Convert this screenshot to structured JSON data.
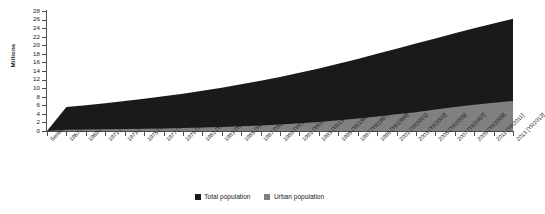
{
  "chart_data": {
    "type": "area",
    "title": "",
    "subtitle": "",
    "xlabel": "",
    "ylabel": "Millions",
    "ylim": [
      0,
      28
    ],
    "ytick_step": 2,
    "yticks": [
      0,
      2,
      4,
      6,
      8,
      10,
      12,
      14,
      16,
      18,
      20,
      22,
      24,
      26,
      28
    ],
    "grid": false,
    "stacked": true,
    "legend_position": "bottom-center",
    "first_category_label": "Series code",
    "categories": [
      "Series code",
      "1967 [YR1967]",
      "1969 [YR1969]",
      "1971 [YR1971]",
      "1973 [YR1973]",
      "1975 [YR1975]",
      "1977 [YR1977]",
      "1979 [YR1979]",
      "1981 [YR1981]",
      "1983 [YR1983]",
      "1985 [YR1985]",
      "1987 [YR1987]",
      "1989 [YR1989]",
      "1991 [YR1991]",
      "1993 [YR1993]",
      "1995 [YR1995]",
      "1997 [YR1997]",
      "1999 [YR1999]",
      "2001 [YR2001]",
      "2003 [YR2003]",
      "2005 [YR2005]",
      "2007 [YR2007]",
      "2009 [YR2009]",
      "2011 [YR2011]",
      "2013 [YR2013]"
    ],
    "series": [
      {
        "name": "Total population",
        "color": "#1a1a1a",
        "values": [
          0,
          5.6,
          6.0,
          6.5,
          7.0,
          7.5,
          8.1,
          8.7,
          9.4,
          10.1,
          10.9,
          11.7,
          12.6,
          13.6,
          14.6,
          15.7,
          16.8,
          18.0,
          19.2,
          20.4,
          21.6,
          22.8,
          24.0,
          25.1,
          26.2
        ]
      },
      {
        "name": "Urban population",
        "color": "#808080",
        "values": [
          0,
          0.3,
          0.35,
          0.4,
          0.45,
          0.5,
          0.6,
          0.7,
          0.8,
          0.95,
          1.1,
          1.3,
          1.5,
          1.8,
          2.1,
          2.5,
          2.9,
          3.4,
          3.9,
          4.4,
          5.0,
          5.6,
          6.1,
          6.6,
          7.0
        ]
      }
    ],
    "legend": [
      {
        "label": "Total population",
        "color": "#1a1a1a",
        "swatch": "total-population-swatch"
      },
      {
        "label": "Urban population",
        "color": "#808080",
        "swatch": "urban-population-swatch"
      }
    ]
  }
}
